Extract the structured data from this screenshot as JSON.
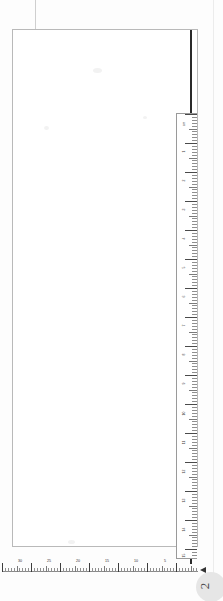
{
  "document": {
    "kind": "scanned-page-with-ruler",
    "orientation": "rotated-sideways",
    "page_number": "2",
    "corner_marker_label": "A",
    "background_color": "#ffffff",
    "frame_color": "#b9b9b9",
    "spine_color": "#2a2a2a",
    "tick_color": "#6f6f6f",
    "label_color": "#2f2f2f"
  },
  "horizontal_ruler": {
    "name": "bottom-scale-bar",
    "unit": "cm",
    "direction": "right-to-left",
    "labels": [
      "30",
      "25",
      "20",
      "15",
      "10",
      "5"
    ],
    "label_positions_px": [
      18,
      47,
      76,
      105,
      134,
      163
    ],
    "minor_tick_spacing_px": 2.9,
    "major_every": 10,
    "length_px": 196
  },
  "vertical_ruler": {
    "name": "right-scale-bar",
    "unit": "cm",
    "direction": "top-to-bottom",
    "labels": [
      "cm",
      "1",
      "2",
      "3",
      "4",
      "5",
      "6",
      "7",
      "8",
      "9",
      "10",
      "11",
      "12",
      "13",
      "14",
      "15"
    ],
    "label_positions_px": [
      8,
      37,
      66,
      95,
      124,
      153,
      182,
      211,
      240,
      269,
      298,
      327,
      356,
      385,
      414,
      440
    ],
    "minor_tick_spacing_px": 2.9,
    "major_every": 10,
    "length_px": 446
  }
}
